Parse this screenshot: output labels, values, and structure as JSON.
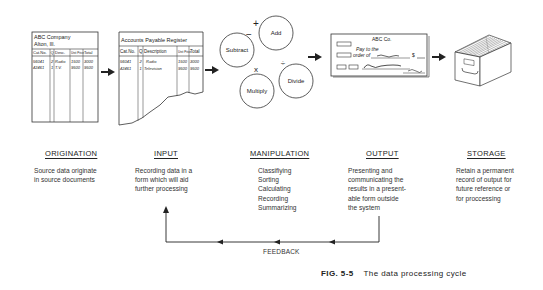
{
  "figure": {
    "caption_number": "FIG. 5-5",
    "caption_text": "The data processing cycle"
  },
  "source_document": {
    "company": "ABC Company",
    "location": "Alton, Ill.",
    "headers": [
      "Cat.No.",
      "Q",
      "Desc.",
      "Unit Price",
      "Total"
    ],
    "rows": [
      [
        "56041",
        "2",
        "Radio",
        "1500",
        "3000"
      ],
      [
        "42461",
        "1",
        "T.V.",
        "9500",
        "9500"
      ]
    ]
  },
  "register": {
    "title": "Accounts Payable Register",
    "headers": [
      "Cat.No.",
      "Q",
      "Description",
      "Unit Price",
      "Total"
    ],
    "rows": [
      [
        "56041",
        "2",
        "Radio",
        "1500",
        "3000"
      ],
      [
        "42461",
        "1",
        "Television",
        "9500",
        "9500"
      ]
    ]
  },
  "operations": [
    {
      "label": "Subtract",
      "symbol": "−"
    },
    {
      "label": "Add",
      "symbol": "+"
    },
    {
      "label": "Multiply",
      "symbol": "x"
    },
    {
      "label": "Divide",
      "symbol": "÷"
    }
  ],
  "check": {
    "company": "ABC Co.",
    "pay_to_line1": "Pay to the",
    "pay_to_line2": "order of",
    "amount_symbol": "$"
  },
  "stages": [
    {
      "title": "ORIGINATION",
      "description": "Source data originate\nin source documents"
    },
    {
      "title": "INPUT",
      "description": "Recording data in a\nform which will aid\nfurther processing"
    },
    {
      "title": "MANIPULATION",
      "description": "Classifiying\nSorting\nCalculating\nRecording\nSummarizing"
    },
    {
      "title": "OUTPUT",
      "description": "Presenting and\ncommunicating the\nresults in a present-\nable form outside\nthe system"
    },
    {
      "title": "STORAGE",
      "description": "Retain a permanent\nrecord of output for\nfuture reference or\nfor proccessing"
    }
  ],
  "feedback": {
    "label": "FEEDBACK"
  },
  "icons": [
    "source-document-icon",
    "register-document-icon",
    "operation-circles-icon",
    "check-icon",
    "file-drawer-icon",
    "arrow-right-icon",
    "arrow-left-icon",
    "arrow-up-icon"
  ]
}
